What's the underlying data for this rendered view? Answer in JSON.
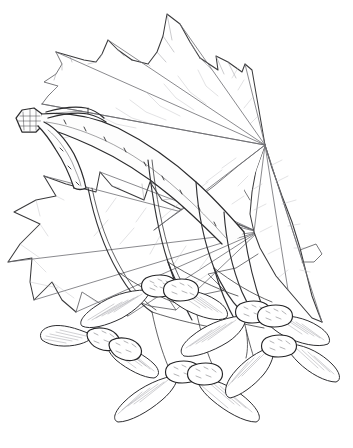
{
  "image": {
    "kind": "botanical-illustration",
    "subject": "Maple branch with leaves and samaras",
    "medium": "pen-and-ink line drawing",
    "background_color": "#ffffff",
    "ink_color": "#2c2c2e",
    "vein_color": "#9a9aa1",
    "width": 353,
    "height": 448,
    "caption": "",
    "signature": ""
  },
  "parts": {
    "twig": {
      "name": "cut twig",
      "cut_end_label": "cut-end",
      "color": "#2c2c2e"
    },
    "leaf_upper": {
      "name": "upper palmate leaf",
      "lobe_count": 5,
      "base_point": [
        265,
        145
      ],
      "petiole_tip": [
        331,
        78
      ]
    },
    "leaf_lower": {
      "name": "lower palmate leaf",
      "lobe_count": 5,
      "base_point": [
        258,
        232
      ]
    },
    "samara_cluster": {
      "name": "paired samaras",
      "pair_count": 5,
      "wing_color": "#ffffff",
      "nutlet_color": "#55555a"
    }
  }
}
